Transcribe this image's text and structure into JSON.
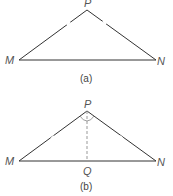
{
  "figures": [
    {
      "caption": "(a)",
      "vertices": {
        "P": {
          "label": "P",
          "x": 87,
          "y": 10
        },
        "M": {
          "label": "M",
          "x": 19,
          "y": 60
        },
        "N": {
          "label": "N",
          "x": 156,
          "y": 60
        }
      },
      "marks": "equal-length ticks on PM and PN"
    },
    {
      "caption": "(b)",
      "vertices": {
        "P": {
          "label": "P",
          "x": 87,
          "y": 111
        },
        "M": {
          "label": "M",
          "x": 19,
          "y": 161
        },
        "N": {
          "label": "N",
          "x": 156,
          "y": 161
        },
        "Q": {
          "label": "Q",
          "x": 87,
          "y": 161
        }
      },
      "marks": "equal-length ticks on PM and PN, dashed bisector PQ, equal angle arcs at P"
    }
  ],
  "colors": {
    "stroke": "#333333",
    "dash": "#999999",
    "label": "#555555"
  }
}
